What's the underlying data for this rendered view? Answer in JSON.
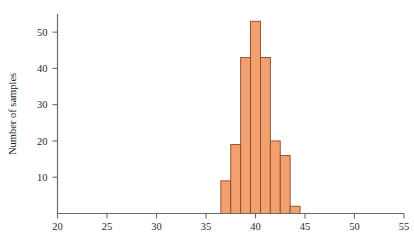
{
  "chart_data": {
    "type": "bar",
    "title": "",
    "subtitle": "",
    "xlabel": "",
    "ylabel": "Number of samples",
    "xlim": [
      20,
      55
    ],
    "ylim": [
      0,
      55
    ],
    "grid": false,
    "legend": null,
    "bar_style": "histogram-contiguous",
    "bin_width": 1,
    "bin_edges": [
      36.5,
      37.5,
      38.5,
      39.5,
      40.5,
      41.5,
      42.5,
      43.5,
      44.5
    ],
    "categories": [
      "36.5-37.5",
      "37.5-38.5",
      "38.5-39.5",
      "39.5-40.5",
      "40.5-41.5",
      "41.5-42.5",
      "42.5-43.5",
      "43.5-44.5"
    ],
    "bin_centers": [
      37,
      38,
      39,
      40,
      41,
      42,
      43,
      44
    ],
    "values": [
      9,
      19,
      43,
      53,
      43,
      20,
      16,
      2
    ],
    "x_ticks": [
      20,
      25,
      30,
      35,
      40,
      45,
      50,
      55
    ],
    "x_tick_labels": [
      "20",
      "25",
      "30",
      "35",
      "40",
      "45",
      "50",
      "55"
    ],
    "y_ticks": [
      10,
      20,
      30,
      40,
      50
    ],
    "y_tick_labels": [
      "10",
      "20",
      "30",
      "40",
      "50"
    ],
    "colors": {
      "bar_fill": "#F2A070",
      "bar_stroke": "#8a4a24",
      "axis": "#6b6b6b",
      "text": "#1a1a1a",
      "background": "#ffffff"
    }
  }
}
